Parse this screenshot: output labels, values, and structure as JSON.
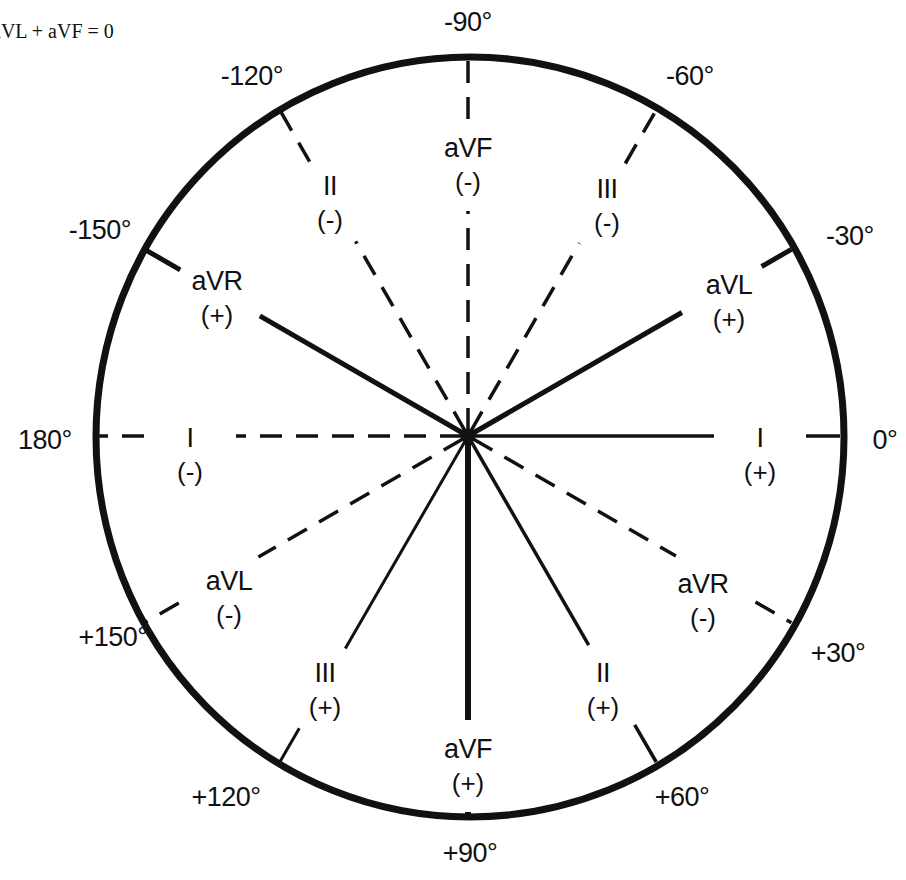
{
  "caption": "aVL + aVF = 0",
  "diagram": {
    "type": "hexaxial-reference-circle",
    "center": [
      470,
      437
    ],
    "radius_x": 374,
    "radius_y": 380,
    "colors": {
      "line": "#111111",
      "background": "#ffffff"
    },
    "degree_labels": [
      {
        "angle": -90,
        "text": "-90°",
        "x": 468,
        "y": 22
      },
      {
        "angle": -60,
        "text": "-60°",
        "x": 690,
        "y": 76
      },
      {
        "angle": -120,
        "text": "-120°",
        "x": 252,
        "y": 76
      },
      {
        "angle": -30,
        "text": "-30°",
        "x": 850,
        "y": 236
      },
      {
        "angle": -150,
        "text": "-150°",
        "x": 100,
        "y": 230
      },
      {
        "angle": 0,
        "text": "0°",
        "x": 885,
        "y": 440
      },
      {
        "angle": 180,
        "text": "180°",
        "x": 45,
        "y": 440
      },
      {
        "angle": 30,
        "text": "+30°",
        "x": 838,
        "y": 653
      },
      {
        "angle": 150,
        "text": "+150°",
        "x": 113,
        "y": 637
      },
      {
        "angle": 60,
        "text": "+60°",
        "x": 682,
        "y": 797
      },
      {
        "angle": 120,
        "text": "+120°",
        "x": 226,
        "y": 797
      },
      {
        "angle": 90,
        "text": "+90°",
        "x": 470,
        "y": 853
      }
    ],
    "axes": [
      {
        "lead": "I",
        "angle": 0,
        "pole": "+",
        "style": "solid",
        "width": 3.5,
        "label_x": 760,
        "label_y": 455
      },
      {
        "lead": "I",
        "angle": 180,
        "pole": "-",
        "style": "dashed",
        "width": 3.5,
        "label_x": 190,
        "label_y": 455
      },
      {
        "lead": "aVL",
        "angle": -30,
        "pole": "+",
        "style": "solid",
        "width": 5,
        "label_x": 729,
        "label_y": 302
      },
      {
        "lead": "aVL",
        "angle": 150,
        "pole": "-",
        "style": "dashed",
        "width": 3.5,
        "label_x": 229,
        "label_y": 598
      },
      {
        "lead": "aVF",
        "angle": -90,
        "pole": "-",
        "style": "dashed",
        "width": 3.5,
        "label_x": 468,
        "label_y": 165
      },
      {
        "lead": "aVF",
        "angle": 90,
        "pole": "+",
        "style": "solid",
        "width": 6,
        "label_x": 468,
        "label_y": 766
      },
      {
        "lead": "II",
        "angle": 60,
        "pole": "+",
        "style": "solid",
        "width": 3.5,
        "label_x": 603,
        "label_y": 690
      },
      {
        "lead": "II",
        "angle": -120,
        "pole": "-",
        "style": "dashed",
        "width": 3.5,
        "label_x": 330,
        "label_y": 203
      },
      {
        "lead": "III",
        "angle": 120,
        "pole": "+",
        "style": "solid",
        "width": 3,
        "label_x": 325,
        "label_y": 690
      },
      {
        "lead": "III",
        "angle": -60,
        "pole": "-",
        "style": "dashed",
        "width": 3.5,
        "label_x": 607,
        "label_y": 206
      },
      {
        "lead": "aVR",
        "angle": -150,
        "pole": "+",
        "style": "solid",
        "width": 5,
        "label_x": 217,
        "label_y": 298
      },
      {
        "lead": "aVR",
        "angle": 30,
        "pole": "-",
        "style": "dashed",
        "width": 3.5,
        "label_x": 703,
        "label_y": 601
      }
    ]
  },
  "labels": {
    "caption": "aVL + aVF = 0",
    "deg_m90": "-90°",
    "deg_m60": "-60°",
    "deg_m120": "-120°",
    "deg_m30": "-30°",
    "deg_m150": "-150°",
    "deg_0": "0°",
    "deg_180": "180°",
    "deg_p30": "+30°",
    "deg_p150": "+150°",
    "deg_p60": "+60°",
    "deg_p120": "+120°",
    "deg_p90": "+90°",
    "lead_I_pos": {
      "name": "I",
      "pole": "(+)"
    },
    "lead_I_neg": {
      "name": "I",
      "pole": "(-)"
    },
    "lead_aVL_pos": {
      "name": "aVL",
      "pole": "(+)"
    },
    "lead_aVL_neg": {
      "name": "aVL",
      "pole": "(-)"
    },
    "lead_aVF_pos": {
      "name": "aVF",
      "pole": "(+)"
    },
    "lead_aVF_neg": {
      "name": "aVF",
      "pole": "(-)"
    },
    "lead_II_pos": {
      "name": "II",
      "pole": "(+)"
    },
    "lead_II_neg": {
      "name": "II",
      "pole": "(-)"
    },
    "lead_III_pos": {
      "name": "III",
      "pole": "(+)"
    },
    "lead_III_neg": {
      "name": "III",
      "pole": "(-)"
    },
    "lead_aVR_pos": {
      "name": "aVR",
      "pole": "(+)"
    },
    "lead_aVR_neg": {
      "name": "aVR",
      "pole": "(-)"
    }
  }
}
